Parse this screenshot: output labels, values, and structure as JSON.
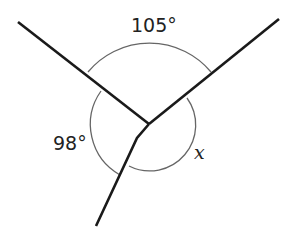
{
  "diagram": {
    "type": "angles-at-a-point",
    "labels": {
      "top_angle": "105°",
      "left_angle": "98°",
      "unknown_angle": "x"
    },
    "colors": {
      "lines": "#1a1a1a",
      "arcs": "#555555"
    }
  }
}
